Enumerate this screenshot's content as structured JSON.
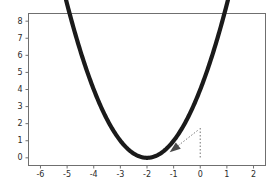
{
  "chart_data": {
    "type": "line",
    "title": "",
    "xlabel": "",
    "ylabel": "",
    "xlim": [
      -6.45,
      2.45
    ],
    "ylim": [
      -0.45,
      8.45
    ],
    "xticks": [
      -6,
      -5,
      -4,
      -3,
      -2,
      -1,
      0,
      1,
      2
    ],
    "xtick_labels": [
      "-6",
      "-5",
      "-4",
      "-3",
      "-2",
      "-1",
      "0",
      "1",
      "2"
    ],
    "yticks": [
      0,
      1,
      2,
      3,
      4,
      5,
      6,
      7,
      8
    ],
    "ytick_labels": [
      "0",
      "1",
      "2",
      "3",
      "4",
      "5",
      "6",
      "7",
      "8"
    ],
    "grid": false,
    "legend": null,
    "series": [
      {
        "name": "y = (x + 2)^2",
        "color": "#1a1a1a",
        "linewidth": 4.2,
        "x": [
          -6.0,
          -5.75,
          -5.5,
          -5.25,
          -5.0,
          -4.75,
          -4.5,
          -4.25,
          -4.0,
          -3.75,
          -3.5,
          -3.25,
          -3.0,
          -2.75,
          -2.5,
          -2.25,
          -2.0,
          -1.75,
          -1.5,
          -1.25,
          -1.0,
          -0.75,
          -0.5,
          -0.25,
          0.0,
          0.25,
          0.5,
          0.75,
          1.0,
          1.25,
          1.5,
          1.75,
          2.0
        ],
        "y": [
          16.0,
          14.06,
          12.25,
          10.56,
          9.0,
          7.56,
          6.25,
          5.06,
          4.0,
          3.06,
          2.25,
          1.56,
          1.0,
          0.56,
          0.25,
          0.06,
          0.0,
          0.06,
          0.25,
          0.56,
          1.0,
          1.56,
          2.25,
          3.06,
          4.0,
          5.06,
          6.25,
          7.56,
          9.0,
          10.56,
          12.25,
          14.06,
          16.0
        ],
        "visible_x_start": -6.0,
        "visible_x_end": 2.0,
        "vertex": [
          -2,
          0
        ]
      }
    ],
    "annotations": [
      {
        "kind": "dotted-vertical-line",
        "name": "dropline-at-x-zero",
        "x": 0,
        "y_from": 1.75,
        "y_to": 0,
        "color": "#8c8c8c"
      },
      {
        "kind": "dotted-arrow",
        "name": "tangent-arrow",
        "from": [
          -0.1,
          1.6
        ],
        "to": [
          -1.15,
          0.32
        ],
        "color": "#4a4a4a"
      }
    ],
    "axes_frame": {
      "visible": true,
      "color": "#6f6f6f",
      "sides": [
        "left",
        "right",
        "top",
        "bottom"
      ]
    },
    "background": "#ffffff"
  }
}
